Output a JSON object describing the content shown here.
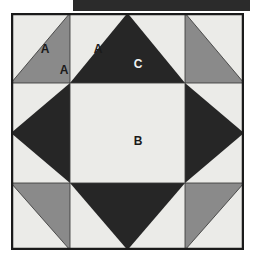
{
  "figure": {
    "name": "quilt-block-diagram",
    "title": "",
    "header_bar": {
      "name": "header-bar",
      "color": "#2b2b2b"
    },
    "colors": {
      "background": "#ebebe8",
      "light": "#ebebe8",
      "medium_gray": "#8a8a8a",
      "dark": "#262626",
      "outline": "#1a1a1a",
      "label_dark": "#1a1a1a",
      "label_light": "#f2f2f2"
    },
    "grid": {
      "columns": 3,
      "rows": 3,
      "outer_border": true
    },
    "patch_labels": [
      {
        "id": "a-top-left-light",
        "text": "A",
        "x": 34,
        "y": 37,
        "tone": "dark"
      },
      {
        "id": "a-top-left-gray",
        "text": "A",
        "x": 53,
        "y": 58,
        "tone": "dark"
      },
      {
        "id": "a-top-center-light",
        "text": "A",
        "x": 87,
        "y": 37,
        "tone": "dark"
      },
      {
        "id": "c-top-center-dark",
        "text": "C",
        "x": 127,
        "y": 52,
        "tone": "light"
      },
      {
        "id": "b-center-light",
        "text": "B",
        "x": 127,
        "y": 129,
        "tone": "dark"
      }
    ],
    "patches": [
      {
        "id": "corner-top-left",
        "shape": "half-square-triangle",
        "light_half": "upper-left",
        "gray_half": "lower-right",
        "label": "A"
      },
      {
        "id": "corner-top-right",
        "shape": "half-square-triangle",
        "light_half": "upper-right",
        "gray_half": "lower-left",
        "label": "A"
      },
      {
        "id": "corner-bottom-left",
        "shape": "half-square-triangle",
        "light_half": "lower-left",
        "gray_half": "upper-right",
        "label": "A"
      },
      {
        "id": "corner-bottom-right",
        "shape": "half-square-triangle",
        "light_half": "lower-right",
        "gray_half": "upper-left",
        "label": "A"
      },
      {
        "id": "edge-top",
        "shape": "flying-geese-dark-triangle",
        "label": "C"
      },
      {
        "id": "edge-left",
        "shape": "flying-geese-dark-triangle",
        "label": "C"
      },
      {
        "id": "edge-right",
        "shape": "flying-geese-dark-triangle",
        "label": "C"
      },
      {
        "id": "edge-bottom",
        "shape": "flying-geese-dark-triangle",
        "label": "C"
      },
      {
        "id": "center-square",
        "shape": "square",
        "label": "B"
      }
    ]
  }
}
